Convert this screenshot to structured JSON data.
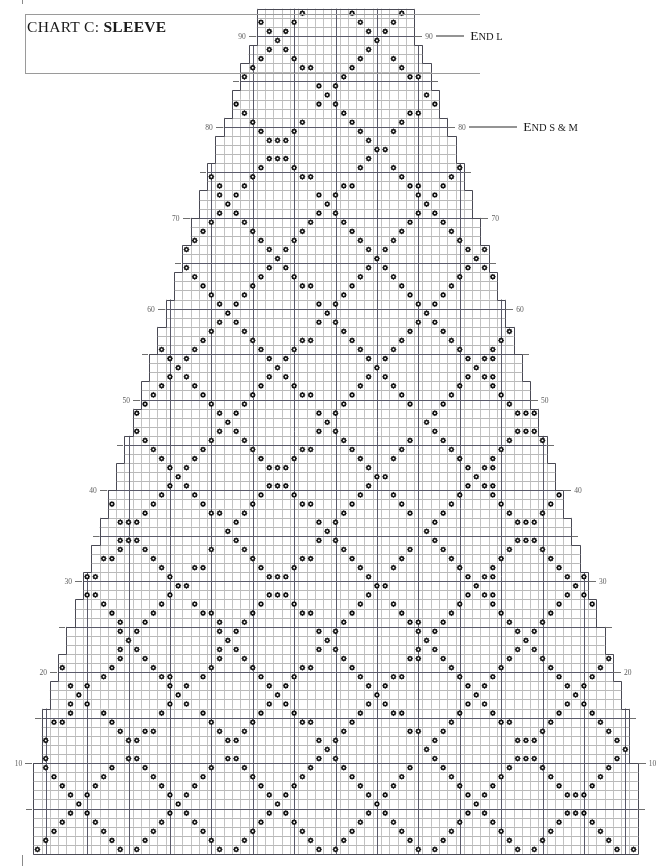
{
  "title": {
    "prefix": "CHART C:",
    "name": "SLEEVE"
  },
  "annotations": [
    {
      "id": "end-l",
      "label_small": "E",
      "label": "ND L",
      "text": "End L",
      "row": 90
    },
    {
      "id": "end-s-m",
      "label_small": "E",
      "label": "ND S & M",
      "text": "End S & M",
      "row": 80
    }
  ],
  "axes": {
    "left_labels": [
      "10",
      "20",
      "30",
      "40",
      "50",
      "60",
      "70",
      "80",
      "90"
    ],
    "right_labels": [
      "10",
      "20",
      "30",
      "40",
      "50",
      "60",
      "70",
      "90"
    ],
    "minor_ticks_left": [
      5,
      15,
      25,
      35,
      45,
      55,
      65,
      75,
      85
    ],
    "minor_ticks_right": [
      5,
      15,
      25,
      35,
      45,
      55,
      65,
      75,
      85
    ],
    "row_min": 1,
    "row_max": 93
  },
  "legend_symbol": {
    "name": "purl-diamond",
    "description": "filled diamond in square"
  },
  "chart_data": {
    "type": "heatmap",
    "xlabel": "stitches",
    "ylabel": "rows",
    "grid": true,
    "columns": 73,
    "rows": 93,
    "cell_px": 8.28,
    "symbol": "diamond",
    "row_widths_note": "sleeve taper: width grows from 19 st at top row 93 to 73 st at bottom row 1",
    "shaping": [
      {
        "row": 93,
        "stitches": 19
      },
      {
        "row": 90,
        "stitches": 19
      },
      {
        "row": 88,
        "stitches": 21
      },
      {
        "row": 85,
        "stitches": 23
      },
      {
        "row": 82,
        "stitches": 25
      },
      {
        "row": 80,
        "stitches": 27
      },
      {
        "row": 77,
        "stitches": 29
      },
      {
        "row": 74,
        "stitches": 31
      },
      {
        "row": 71,
        "stitches": 33
      },
      {
        "row": 68,
        "stitches": 35
      },
      {
        "row": 65,
        "stitches": 37
      },
      {
        "row": 62,
        "stitches": 39
      },
      {
        "row": 59,
        "stitches": 41
      },
      {
        "row": 56,
        "stitches": 43
      },
      {
        "row": 53,
        "stitches": 45
      },
      {
        "row": 50,
        "stitches": 47
      },
      {
        "row": 47,
        "stitches": 49
      },
      {
        "row": 44,
        "stitches": 51
      },
      {
        "row": 41,
        "stitches": 53
      },
      {
        "row": 38,
        "stitches": 55
      },
      {
        "row": 35,
        "stitches": 57
      },
      {
        "row": 32,
        "stitches": 59
      },
      {
        "row": 29,
        "stitches": 61
      },
      {
        "row": 26,
        "stitches": 63
      },
      {
        "row": 23,
        "stitches": 65
      },
      {
        "row": 20,
        "stitches": 67
      },
      {
        "row": 17,
        "stitches": 69
      },
      {
        "row": 14,
        "stitches": 71
      },
      {
        "row": 11,
        "stitches": 71
      },
      {
        "row": 8,
        "stitches": 73
      },
      {
        "row": 1,
        "stitches": 73
      }
    ],
    "motif": {
      "name": "diagonal lattice diamond",
      "repeat_width": 12,
      "repeat_height": 12,
      "description": "Filled diamond symbols placed on intersecting diagonals forming an argyle-style trellis of diamonds across the sleeve."
    },
    "heavy_gridline_every": 5,
    "axis_tick_major": 10,
    "axis_tick_minor": 5
  }
}
